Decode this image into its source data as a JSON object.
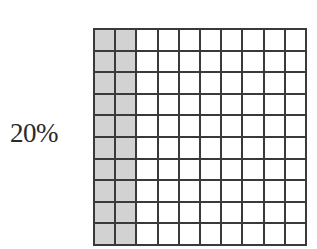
{
  "label": "20%",
  "grid": {
    "rows": 10,
    "cols": 10,
    "shaded_columns": 2,
    "shaded_cells": 20,
    "total_cells": 100,
    "shade_color": "#d2d2d2",
    "line_color": "#3a3a3a"
  }
}
